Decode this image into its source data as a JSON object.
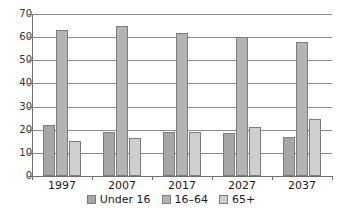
{
  "chart_data": {
    "type": "bar",
    "title": "",
    "subtitle": "",
    "xlabel": "",
    "ylabel": "",
    "categories": [
      "1997",
      "2007",
      "2017",
      "2027",
      "2037"
    ],
    "series": [
      {
        "name": "Under 16",
        "color": "#a6a6a6",
        "values": [
          22,
          19,
          19,
          18.5,
          17
        ]
      },
      {
        "name": "16–64",
        "color": "#b4b4b4",
        "values": [
          63,
          65,
          62,
          60,
          58
        ]
      },
      {
        "name": "65+",
        "color": "#cfcfcf",
        "values": [
          15,
          16.5,
          19,
          21,
          24.5
        ]
      }
    ],
    "ylim": [
      0,
      70
    ],
    "ytick_values": [
      0,
      10,
      20,
      30,
      40,
      50,
      60,
      70
    ],
    "ytick_labels": [
      "0",
      "10",
      "20",
      "30",
      "40",
      "50",
      "60",
      "70"
    ],
    "grid": true,
    "grid_axis": "y",
    "legend_position": "bottom",
    "annotations": []
  },
  "legend": {
    "items": [
      {
        "label": "Under 16"
      },
      {
        "label": "16–64"
      },
      {
        "label": "65+"
      }
    ]
  },
  "caption": {
    "text": ""
  }
}
